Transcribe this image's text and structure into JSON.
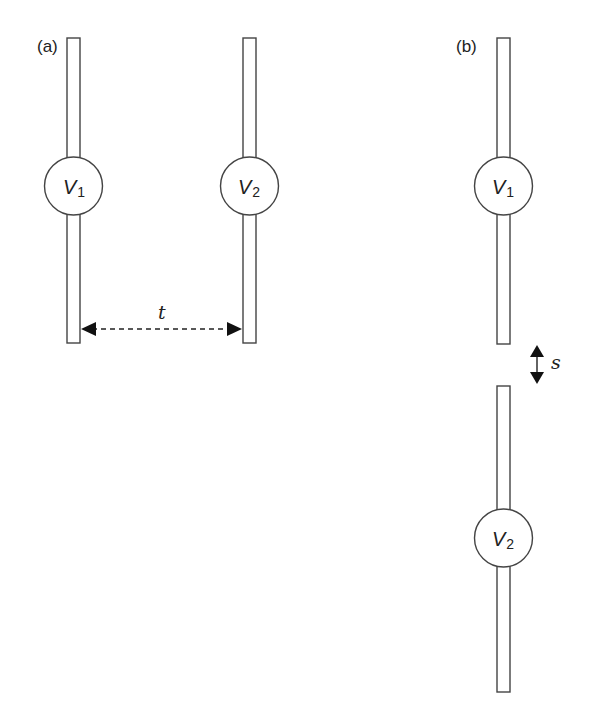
{
  "panels": [
    {
      "id": "a",
      "label": "(a)",
      "electrodes": [
        {
          "name": "V",
          "subscript": "1"
        },
        {
          "name": "V",
          "subscript": "2"
        }
      ],
      "dimension": {
        "label": "t",
        "orientation": "horizontal",
        "style": "dashed double arrow"
      }
    },
    {
      "id": "b",
      "label": "(b)",
      "electrodes": [
        {
          "name": "V",
          "subscript": "1"
        },
        {
          "name": "V",
          "subscript": "2"
        }
      ],
      "dimension": {
        "label": "s",
        "orientation": "vertical",
        "style": "solid double arrow"
      }
    }
  ],
  "colors": {
    "stroke": "#333333",
    "fill": "#ffffff",
    "arrow": "#111111"
  }
}
